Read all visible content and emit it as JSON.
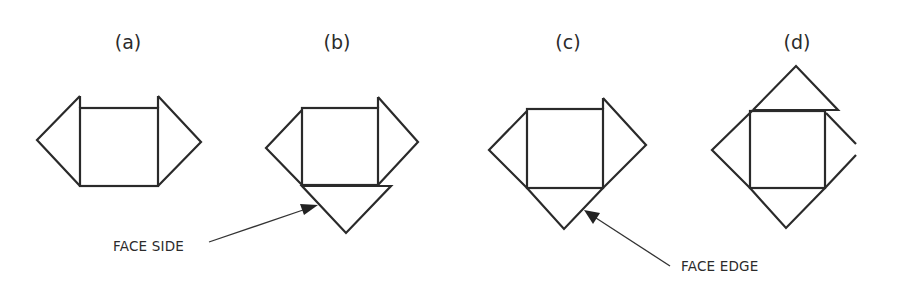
{
  "figures": [
    {
      "id": "a",
      "label": "(a)",
      "description": "Square with two side flaps (left and right triangles)"
    },
    {
      "id": "b",
      "label": "(b)",
      "description": "Square with left, right and bottom triangles; bottom flap folded"
    },
    {
      "id": "c",
      "label": "(c)",
      "description": "Square with left, right and bottom triangles"
    },
    {
      "id": "d",
      "label": "(d)",
      "description": "Square with four triangles on all sides"
    }
  ],
  "callouts": {
    "face_side": "FACE SIDE",
    "face_edge": "FACE EDGE"
  },
  "colors": {
    "stroke": "#2a2a2a",
    "background": "#ffffff"
  }
}
